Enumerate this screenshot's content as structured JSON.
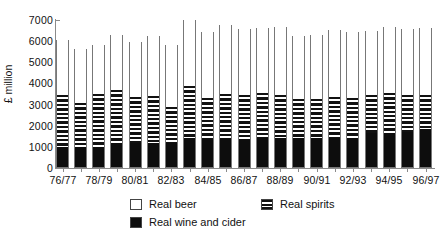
{
  "chart_data": {
    "type": "bar",
    "subtype": "stacked-bar",
    "title": "",
    "xlabel": "",
    "ylabel": "£ million",
    "ylim": [
      0,
      7000
    ],
    "ytick_step": 1000,
    "yticks": [
      "7000",
      "6000",
      "5000",
      "4000",
      "3000",
      "2000",
      "1000",
      "0"
    ],
    "grid": false,
    "legend_position": "bottom",
    "categories": [
      "76/77",
      "77/78",
      "78/79",
      "79/80",
      "80/81",
      "81/82",
      "82/83",
      "83/84",
      "84/85",
      "85/86",
      "86/87",
      "87/88",
      "88/89",
      "89/90",
      "90/91",
      "91/92",
      "92/93",
      "93/94",
      "94/95",
      "95/96",
      "96/97"
    ],
    "visible_tick_labels": [
      "76/77",
      "78/79",
      "80/81",
      "82/83",
      "84/85",
      "86/87",
      "88/89",
      "90/91",
      "92/93",
      "94/95",
      "96/97"
    ],
    "series": [
      {
        "name": "Real wine and cider",
        "fill": "solid-black",
        "color": "#0d0d0d",
        "values": [
          930,
          940,
          930,
          1130,
          1130,
          1140,
          1140,
          1370,
          1340,
          1330,
          1340,
          1370,
          1380,
          1360,
          1350,
          1370,
          1360,
          1590,
          1620,
          1640,
          1810
        ]
      },
      {
        "name": "Real spirits",
        "fill": "horizontal-stripes",
        "color": "#111111",
        "values": [
          2470,
          2100,
          2520,
          2530,
          2170,
          2200,
          1680,
          2470,
          1910,
          2130,
          2050,
          2110,
          2050,
          1850,
          1890,
          1950,
          1890,
          1800,
          1860,
          1760,
          1590
        ]
      },
      {
        "name": "Real beer",
        "fill": "white",
        "color": "#ffffff",
        "values": [
          2660,
          2570,
          2390,
          2650,
          2670,
          2890,
          2980,
          3160,
          3190,
          3300,
          3200,
          3150,
          3240,
          3030,
          3060,
          3220,
          3160,
          3070,
          3190,
          3190,
          3200
        ]
      }
    ],
    "totals": [
      6060,
      5610,
      5840,
      6310,
      5970,
      6230,
      5800,
      7000,
      6440,
      6760,
      6590,
      6630,
      6670,
      6240,
      6300,
      6540,
      6410,
      6460,
      6670,
      6590,
      6600
    ]
  },
  "legend": {
    "items": [
      {
        "key": "beer",
        "label": "Real beer"
      },
      {
        "key": "wine",
        "label": "Real wine and cider"
      },
      {
        "key": "spirits",
        "label": "Real spirits"
      }
    ]
  }
}
